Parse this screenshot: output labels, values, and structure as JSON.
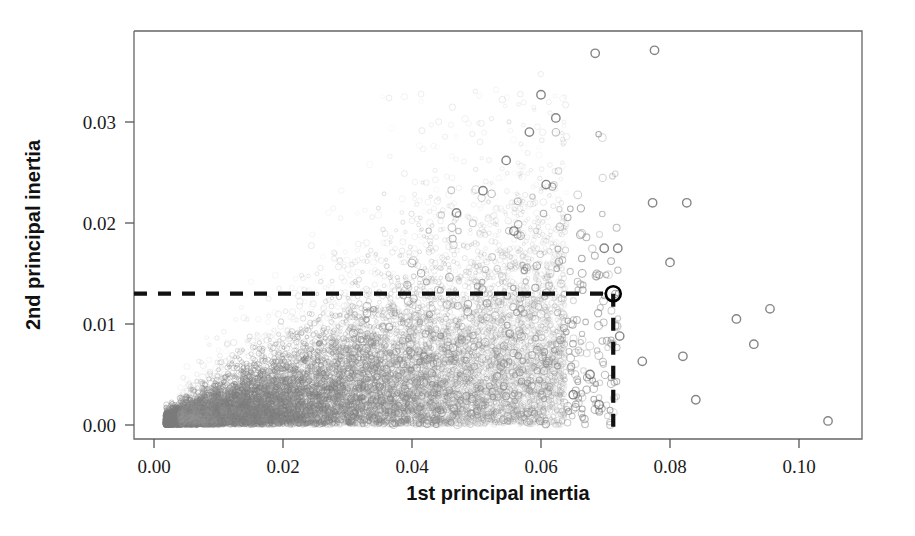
{
  "chart_data": {
    "type": "scatter",
    "title": "",
    "xlabel": "1st principal inertia",
    "ylabel": "2nd principal inertia",
    "xlim": [
      -0.002,
      0.1105
    ],
    "ylim": [
      -0.0015,
      0.0392
    ],
    "xticks": [
      0.0,
      0.02,
      0.04,
      0.06,
      0.08,
      0.1
    ],
    "xticklabels": [
      "0.00",
      "0.02",
      "0.04",
      "0.06",
      "0.08",
      "0.10"
    ],
    "yticks": [
      0.0,
      0.01,
      0.02,
      0.03
    ],
    "yticklabels": [
      "0.00",
      "0.01",
      "0.02",
      "0.03"
    ],
    "grid": false,
    "legend": null,
    "marker": "open-circle",
    "point_color": "#808080",
    "annotations": [
      {
        "name": "selected-point",
        "x": 0.0712,
        "y": 0.013,
        "marker": "bold-open-circle",
        "color": "#000000"
      },
      {
        "name": "horizontal-guide",
        "type": "dashed-line",
        "y": 0.013,
        "x_from": 0.0,
        "x_to": 0.0712,
        "color": "#111111"
      },
      {
        "name": "vertical-guide",
        "type": "dashed-line",
        "x": 0.0712,
        "y_from": 0.0,
        "y_to": 0.013,
        "color": "#111111"
      }
    ],
    "sparse_points": [
      [
        0.0684,
        0.0368
      ],
      [
        0.0776,
        0.0371
      ],
      [
        0.06,
        0.0327
      ],
      [
        0.0623,
        0.0304
      ],
      [
        0.0582,
        0.029
      ],
      [
        0.0546,
        0.0262
      ],
      [
        0.0608,
        0.0238
      ],
      [
        0.0773,
        0.022
      ],
      [
        0.0826,
        0.022
      ],
      [
        0.051,
        0.0232
      ],
      [
        0.0698,
        0.0175
      ],
      [
        0.0719,
        0.0175
      ],
      [
        0.08,
        0.0161
      ],
      [
        0.0469,
        0.021
      ],
      [
        0.0558,
        0.0192
      ],
      [
        0.0903,
        0.0105
      ],
      [
        0.0955,
        0.0115
      ],
      [
        0.082,
        0.0068
      ],
      [
        0.093,
        0.008
      ],
      [
        0.084,
        0.0025
      ],
      [
        0.1045,
        0.0004
      ],
      [
        0.0757,
        0.0063
      ],
      [
        0.0722,
        0.0088
      ],
      [
        0.0676,
        0.005
      ],
      [
        0.065,
        0.003
      ],
      [
        0.069,
        0.002
      ]
    ]
  },
  "axes": {
    "x_title": "1st principal inertia",
    "y_title": "2nd principal inertia"
  }
}
